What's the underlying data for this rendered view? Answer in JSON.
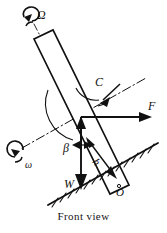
{
  "figure": {
    "caption": "Front view",
    "labels": {
      "precession": "Ω",
      "spin": "ω",
      "couple": "C",
      "force": "F",
      "angle": "β",
      "height": "h",
      "weight": "W",
      "origin": "O"
    },
    "colors": {
      "ink": "#111111",
      "background": "#ffffff"
    },
    "elements": {
      "rod_name": "inclined-rod",
      "ground_name": "hatched-ground-line",
      "axis_name": "dash-dot-axis",
      "spin_arrow_top": "precession-spin-arrow",
      "spin_arrow_bottom": "spin-arrow",
      "couple_arc": "couple-arc-arrow",
      "force_vector": "force-vector-arrow",
      "weight_vector": "weight-vector-arrow",
      "height_dimension": "height-dimension-arrow",
      "angle_arc": "beta-angle-arc"
    }
  }
}
